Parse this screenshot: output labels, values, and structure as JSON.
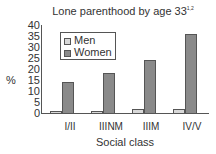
{
  "chart_data": {
    "type": "bar",
    "title": "Lone parenthood by age 33",
    "title_superscript": "1,2",
    "xlabel": "Social class",
    "ylabel": "%",
    "ylim": [
      0,
      40
    ],
    "yticks": [
      "40",
      "35",
      "30",
      "25",
      "20",
      "15",
      "10",
      "5",
      "0"
    ],
    "categories": [
      "I/II",
      "IIINM",
      "IIIM",
      "IV/V"
    ],
    "series": [
      {
        "name": "Men",
        "values": [
          1,
          1,
          2,
          2
        ],
        "color": "#d8d8d8"
      },
      {
        "name": "Women",
        "values": [
          14,
          18,
          24,
          36
        ],
        "color": "#8a8a8a"
      }
    ],
    "legend_position": "upper-left",
    "grid": false
  }
}
